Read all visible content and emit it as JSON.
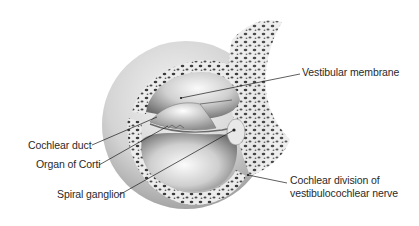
{
  "figure": {
    "labels": [
      {
        "id": "vestibular-membrane",
        "text": "Vestibular membrane",
        "side": "right"
      },
      {
        "id": "cochlear-duct",
        "text": "Cochlear duct",
        "side": "left"
      },
      {
        "id": "organ-of-corti",
        "text": "Organ of Corti",
        "side": "left"
      },
      {
        "id": "spiral-ganglion",
        "text": "Spiral ganglion",
        "side": "left"
      },
      {
        "id": "cochlear-division",
        "lines": [
          "Cochlear division of",
          "vestibulocochlear nerve"
        ],
        "side": "right"
      }
    ]
  },
  "colors": {
    "background": "#ffffff",
    "text": "#2a2a2a",
    "leader_line": "#1a1a1a",
    "bone_fill": "#dcdcdc",
    "bone_pores": "#3c3c3c",
    "lumen_light": "#f2f2f2",
    "lumen_dark": "#8a8a8a"
  }
}
